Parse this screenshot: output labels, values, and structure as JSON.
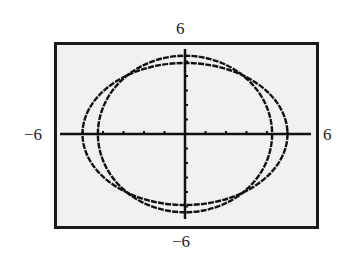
{
  "chart_data": {
    "type": "line",
    "title": "",
    "xlabel": "",
    "ylabel": "",
    "xlim": [
      -6,
      6
    ],
    "ylim": [
      -6,
      6
    ],
    "grid": false,
    "tick_step": 1,
    "tick_labels": {
      "xmin": "−6",
      "xmax": "6",
      "ymin": "−6",
      "ymax": "6"
    },
    "series": [
      {
        "name": "ellipse-wide",
        "kind": "ellipse",
        "center": [
          0,
          0
        ],
        "semi_x": 5.0,
        "semi_y": 4.9
      },
      {
        "name": "ellipse-tall",
        "kind": "ellipse",
        "center": [
          0,
          0
        ],
        "semi_x": 4.25,
        "semi_y": 5.4
      }
    ]
  },
  "colors": {
    "background": "#f1f1f1",
    "frame": "#1a1a1a",
    "curve": "#111111"
  }
}
